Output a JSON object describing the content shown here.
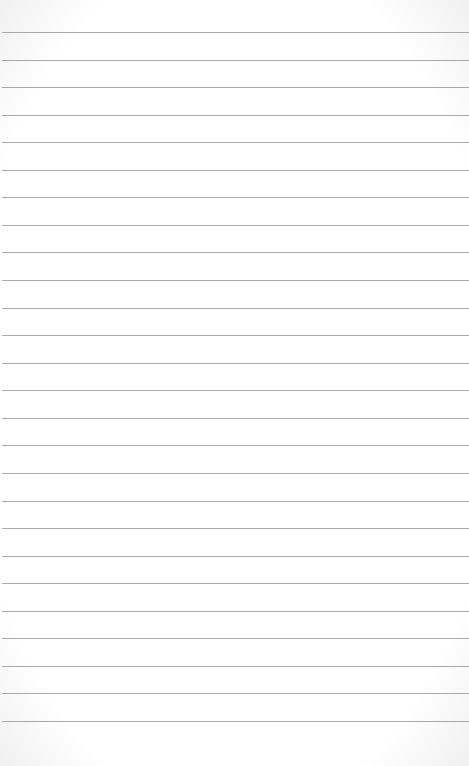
{
  "paper": {
    "type": "ruled-notebook-page",
    "line_count": 26,
    "first_line_y": 32,
    "line_spacing": 27.56,
    "line_color": "#a8a8a8",
    "background_color": "#ffffff"
  }
}
